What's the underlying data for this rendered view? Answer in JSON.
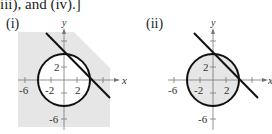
{
  "header": {
    "text": "iii), and (iv).]"
  },
  "panels": [
    {
      "label": "(i)",
      "shading": "outside circle, below line",
      "axes": {
        "x_label": "x",
        "y_label": "y",
        "x_ticks": [
          "-6",
          "-2",
          "2"
        ],
        "y_ticks": [
          "2",
          "-6"
        ]
      }
    },
    {
      "label": "(ii)",
      "shading": "inside circle, below line",
      "axes": {
        "x_label": "x",
        "y_label": "y",
        "x_ticks": [
          "-6",
          "-2",
          "2"
        ],
        "y_ticks": [
          "2",
          "-6"
        ]
      }
    }
  ],
  "colors": {
    "shade": "#e6e6e6",
    "stroke": "#111111",
    "axis": "#777777"
  }
}
